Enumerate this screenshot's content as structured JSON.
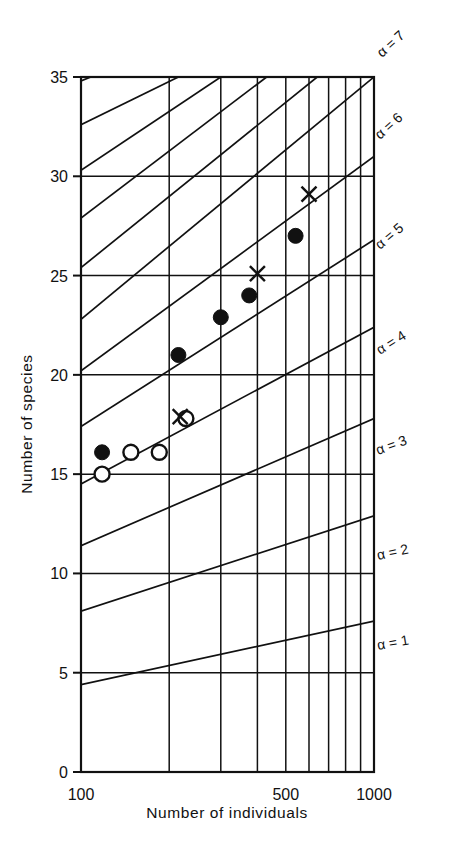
{
  "chart_data": {
    "type": "scatter",
    "title": "",
    "xlabel": "Number of individuals",
    "ylabel": "Number of species",
    "xscale": "log",
    "yscale": "linear",
    "xlim": [
      100,
      1000
    ],
    "ylim": [
      0,
      35
    ],
    "grid": true,
    "x_ticks": [
      100,
      500,
      1000
    ],
    "x_tick_labels": [
      "100",
      "500",
      "1000"
    ],
    "x_gridlines": [
      100,
      200,
      300,
      400,
      500,
      600,
      700,
      800,
      900,
      1000
    ],
    "y_ticks": [
      0,
      5,
      10,
      15,
      20,
      25,
      30,
      35
    ],
    "y_tick_labels": [
      "0",
      "5",
      "10",
      "15",
      "20",
      "25",
      "30",
      "35"
    ],
    "legend_position": "none",
    "annotations": [
      {
        "text": "α = 7",
        "alpha": 7
      },
      {
        "text": "α = 6",
        "alpha": 6
      },
      {
        "text": "α = 5",
        "alpha": 5
      },
      {
        "text": "α = 4",
        "alpha": 4
      },
      {
        "text": "α = 3",
        "alpha": 3
      },
      {
        "text": "α = 2",
        "alpha": 2
      },
      {
        "text": "α = 1",
        "alpha": 1
      }
    ],
    "iso_alpha_curves": [
      {
        "alpha": 1,
        "label": "α = 1",
        "points": [
          [
            100,
            4.4
          ],
          [
            1000,
            7.6
          ]
        ]
      },
      {
        "alpha": 2,
        "label": "α = 2",
        "points": [
          [
            100,
            8.1
          ],
          [
            1000,
            12.9
          ]
        ]
      },
      {
        "alpha": 3,
        "label": "α = 3",
        "points": [
          [
            100,
            11.4
          ],
          [
            1000,
            17.8
          ]
        ]
      },
      {
        "alpha": 4,
        "label": "α = 4",
        "points": [
          [
            100,
            14.5
          ],
          [
            1000,
            22.4
          ]
        ]
      },
      {
        "alpha": 5,
        "label": "α = 5",
        "points": [
          [
            100,
            17.4
          ],
          [
            1000,
            26.8
          ]
        ]
      },
      {
        "alpha": 6,
        "label": "α = 6",
        "points": [
          [
            100,
            20.2
          ],
          [
            1000,
            31.0
          ]
        ]
      },
      {
        "alpha": 7,
        "label": "α = 7",
        "points": [
          [
            100,
            22.8
          ],
          [
            1000,
            35.0
          ]
        ]
      },
      {
        "alpha": 8,
        "label": "",
        "points": [
          [
            100,
            25.4
          ],
          [
            640,
            35.0
          ]
        ]
      },
      {
        "alpha": 9,
        "label": "",
        "points": [
          [
            100,
            27.9
          ],
          [
            430,
            35.0
          ]
        ]
      },
      {
        "alpha": 10,
        "label": "",
        "points": [
          [
            100,
            30.3
          ],
          [
            300,
            35.0
          ]
        ]
      },
      {
        "alpha": 11,
        "label": "",
        "points": [
          [
            100,
            32.6
          ],
          [
            215,
            35.0
          ]
        ]
      },
      {
        "alpha": 12,
        "label": "",
        "points": [
          [
            100,
            34.8
          ],
          [
            108,
            35.0
          ]
        ]
      }
    ],
    "series": [
      {
        "name": "filled-circles",
        "marker": "filled-circle",
        "points": [
          {
            "x": 118,
            "y": 16.1
          },
          {
            "x": 215,
            "y": 21.0
          },
          {
            "x": 300,
            "y": 22.9
          },
          {
            "x": 375,
            "y": 24.0
          },
          {
            "x": 540,
            "y": 27.0
          }
        ]
      },
      {
        "name": "open-circles",
        "marker": "open-circle",
        "points": [
          {
            "x": 118,
            "y": 15.0
          },
          {
            "x": 148,
            "y": 16.1
          },
          {
            "x": 185,
            "y": 16.1
          },
          {
            "x": 228,
            "y": 17.8
          }
        ]
      },
      {
        "name": "crosses",
        "marker": "cross",
        "points": [
          {
            "x": 218,
            "y": 17.9
          },
          {
            "x": 400,
            "y": 25.1
          },
          {
            "x": 600,
            "y": 29.1
          }
        ]
      }
    ]
  },
  "axes": {
    "x_title": "Number of individuals",
    "y_title": "Number of species"
  }
}
